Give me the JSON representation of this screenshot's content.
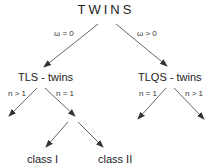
{
  "diagram": {
    "title": "TWINS",
    "nodes": {
      "root": "TWINS",
      "left": "TLS - twins",
      "right": "TLQS - twins",
      "class1": "class I",
      "class2": "class II"
    },
    "edges": {
      "root_left": "ω = 0",
      "root_right": "ω > 0",
      "tls_left": "n > 1",
      "tls_right": "n = 1",
      "tlqs_left": "n = 1",
      "tlqs_right": "n > 1"
    },
    "colors": {
      "line": "#666666",
      "text": "#222222"
    }
  }
}
